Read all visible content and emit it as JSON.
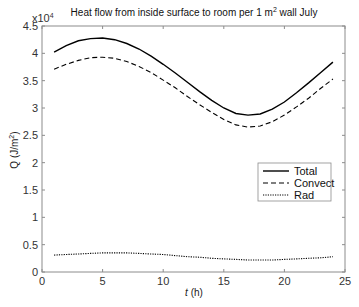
{
  "chart_data": {
    "type": "line",
    "title": "Heat flow from inside surface to room per 1 m",
    "title_sup": "2",
    "title_suffix": " wall July",
    "xlabel_italic": "t",
    "xlabel_rest": " (h)",
    "ylabel_main": "Q (J/m",
    "ylabel_sup": "2",
    "ylabel_close": ")",
    "y_multiplier": "x10",
    "y_multiplier_exp": "4",
    "xlim": [
      0,
      25
    ],
    "ylim": [
      0,
      4.5
    ],
    "x_ticks": [
      0,
      5,
      10,
      15,
      20,
      25
    ],
    "x_tick_labels": [
      "0",
      "5",
      "10",
      "15",
      "20",
      "25"
    ],
    "y_ticks": [
      0,
      0.5,
      1,
      1.5,
      2,
      2.5,
      3,
      3.5,
      4,
      4.5
    ],
    "y_tick_labels": [
      "0",
      "0.5",
      "1",
      "1.5",
      "2",
      "2.5",
      "3",
      "3.5",
      "4",
      "4.5"
    ],
    "grid": false,
    "legend_position": "right-middle",
    "x": [
      1,
      2,
      3,
      4,
      5,
      6,
      7,
      8,
      9,
      10,
      11,
      12,
      13,
      14,
      15,
      16,
      17,
      18,
      19,
      20,
      21,
      22,
      23,
      24
    ],
    "series": [
      {
        "name": "Total",
        "style": "solid",
        "color": "#000000",
        "values": [
          4.02,
          4.14,
          4.23,
          4.27,
          4.28,
          4.25,
          4.18,
          4.08,
          3.95,
          3.8,
          3.64,
          3.47,
          3.3,
          3.14,
          3.0,
          2.9,
          2.87,
          2.89,
          2.98,
          3.11,
          3.28,
          3.46,
          3.65,
          3.84
        ]
      },
      {
        "name": "Convect",
        "style": "dashed",
        "color": "#000000",
        "values": [
          3.71,
          3.8,
          3.87,
          3.92,
          3.93,
          3.91,
          3.85,
          3.76,
          3.65,
          3.51,
          3.37,
          3.21,
          3.06,
          2.92,
          2.79,
          2.69,
          2.65,
          2.67,
          2.75,
          2.87,
          3.02,
          3.18,
          3.36,
          3.53
        ]
      },
      {
        "name": "Rad",
        "style": "dotted",
        "color": "#000000",
        "values": [
          0.31,
          0.32,
          0.33,
          0.34,
          0.35,
          0.35,
          0.35,
          0.34,
          0.33,
          0.32,
          0.3,
          0.28,
          0.27,
          0.25,
          0.24,
          0.23,
          0.22,
          0.22,
          0.22,
          0.23,
          0.24,
          0.25,
          0.26,
          0.28
        ]
      }
    ]
  }
}
